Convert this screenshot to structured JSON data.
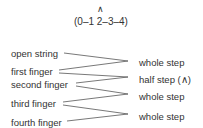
{
  "header": {
    "caret": "∧",
    "fingering": "(0–1 2–3–4)"
  },
  "fingers": [
    {
      "label": "open string"
    },
    {
      "label": "first finger"
    },
    {
      "label": "second finger"
    },
    {
      "label": "third finger"
    },
    {
      "label": "fourth finger"
    }
  ],
  "steps": [
    {
      "label": "whole step"
    },
    {
      "label": "half step (∧)"
    },
    {
      "label": "whole step"
    },
    {
      "label": "whole step"
    }
  ],
  "colors": {
    "text": "#333333",
    "line": "#555555"
  }
}
